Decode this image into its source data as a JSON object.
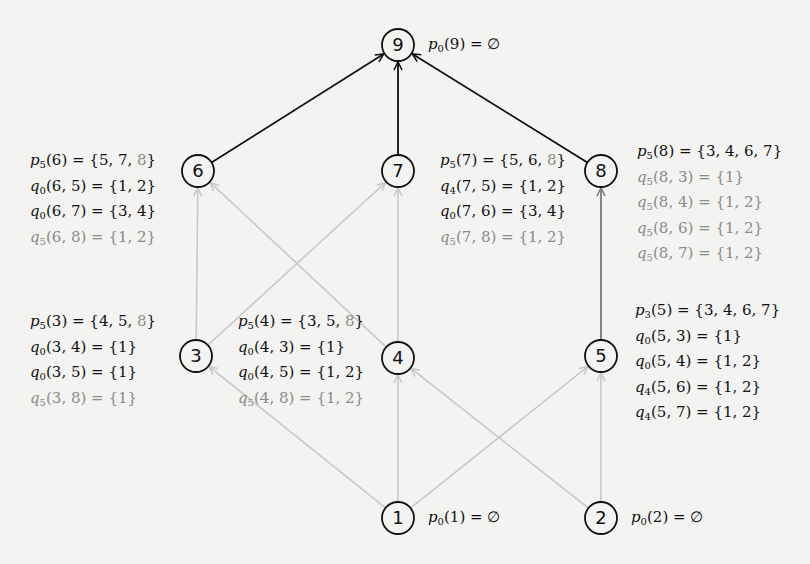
{
  "diagram": {
    "colors": {
      "background": "#f3f3f1",
      "strong_edge": "#111111",
      "medium_edge": "#7a7a7a",
      "light_edge": "#c8c8c8",
      "node_stroke": "#111111",
      "gray_text": "#8a8a8a"
    },
    "nodes": [
      {
        "id": "1",
        "label": "1",
        "x": 398,
        "y": 518
      },
      {
        "id": "2",
        "label": "2",
        "x": 601,
        "y": 518
      },
      {
        "id": "3",
        "label": "3",
        "x": 196,
        "y": 356
      },
      {
        "id": "4",
        "label": "4",
        "x": 398,
        "y": 358
      },
      {
        "id": "5",
        "label": "5",
        "x": 601,
        "y": 356
      },
      {
        "id": "6",
        "label": "6",
        "x": 198,
        "y": 171
      },
      {
        "id": "7",
        "label": "7",
        "x": 398,
        "y": 171
      },
      {
        "id": "8",
        "label": "8",
        "x": 601,
        "y": 171
      },
      {
        "id": "9",
        "label": "9",
        "x": 398,
        "y": 45
      }
    ],
    "edges": [
      {
        "from": "1",
        "to": "3",
        "style": "light"
      },
      {
        "from": "1",
        "to": "4",
        "style": "light"
      },
      {
        "from": "1",
        "to": "5",
        "style": "light"
      },
      {
        "from": "2",
        "to": "4",
        "style": "light"
      },
      {
        "from": "2",
        "to": "5",
        "style": "light"
      },
      {
        "from": "3",
        "to": "6",
        "style": "light"
      },
      {
        "from": "3",
        "to": "7",
        "style": "light"
      },
      {
        "from": "4",
        "to": "6",
        "style": "light"
      },
      {
        "from": "4",
        "to": "7",
        "style": "light"
      },
      {
        "from": "5",
        "to": "8",
        "style": "medium"
      },
      {
        "from": "6",
        "to": "9",
        "style": "strong"
      },
      {
        "from": "7",
        "to": "9",
        "style": "strong"
      },
      {
        "from": "8",
        "to": "9",
        "style": "strong"
      }
    ],
    "annotations": {
      "n9": {
        "lines": [
          {
            "fn": "p",
            "sub": "0",
            "args": "(9)",
            "rhs": " = ∅",
            "gray": false
          }
        ]
      },
      "n1": {
        "lines": [
          {
            "fn": "p",
            "sub": "0",
            "args": "(1)",
            "rhs": " = ∅",
            "gray": false
          }
        ]
      },
      "n2": {
        "lines": [
          {
            "fn": "p",
            "sub": "0",
            "args": "(2)",
            "rhs": " = ∅",
            "gray": false
          }
        ]
      },
      "n6": {
        "lines": [
          {
            "fn": "p",
            "sub": "5",
            "args": "(6)",
            "rhs": " = {5, 7, ",
            "rhs_gray": "8",
            "rhs_end": "}",
            "gray": false
          },
          {
            "fn": "q",
            "sub": "0",
            "args": "(6, 5)",
            "rhs": " = {1, 2}",
            "gray": false
          },
          {
            "fn": "q",
            "sub": "0",
            "args": "(6, 7)",
            "rhs": " = {3, 4}",
            "gray": false
          },
          {
            "fn": "q",
            "sub": "5",
            "args": "(6, 8)",
            "rhs": " = {1, 2}",
            "gray": true
          }
        ]
      },
      "n7": {
        "lines": [
          {
            "fn": "p",
            "sub": "5",
            "args": "(7)",
            "rhs": " = {5, 6, ",
            "rhs_gray": "8",
            "rhs_end": "}",
            "gray": false
          },
          {
            "fn": "q",
            "sub": "4",
            "args": "(7, 5)",
            "rhs": " = {1, 2}",
            "gray": false
          },
          {
            "fn": "q",
            "sub": "0",
            "args": "(7, 6)",
            "rhs": " = {3, 4}",
            "gray": false
          },
          {
            "fn": "q",
            "sub": "5",
            "args": "(7, 8)",
            "rhs": " = {1, 2}",
            "gray": true
          }
        ]
      },
      "n8": {
        "lines": [
          {
            "fn": "p",
            "sub": "5",
            "args": "(8)",
            "rhs": " = {3, 4, 6, 7}",
            "gray": false
          },
          {
            "fn": "q",
            "sub": "5",
            "args": "(8, 3)",
            "rhs": " = {1}",
            "gray": true
          },
          {
            "fn": "q",
            "sub": "5",
            "args": "(8, 4)",
            "rhs": " = {1, 2}",
            "gray": true
          },
          {
            "fn": "q",
            "sub": "5",
            "args": "(8, 6)",
            "rhs": " = {1, 2}",
            "gray": true
          },
          {
            "fn": "q",
            "sub": "5",
            "args": "(8, 7)",
            "rhs": " = {1, 2}",
            "gray": true
          }
        ]
      },
      "n3": {
        "lines": [
          {
            "fn": "p",
            "sub": "5",
            "args": "(3)",
            "rhs": " = {4, 5, ",
            "rhs_gray": "8",
            "rhs_end": "}",
            "gray": false
          },
          {
            "fn": "q",
            "sub": "0",
            "args": "(3, 4)",
            "rhs": " = {1}",
            "gray": false
          },
          {
            "fn": "q",
            "sub": "0",
            "args": "(3, 5)",
            "rhs": " = {1}",
            "gray": false
          },
          {
            "fn": "q",
            "sub": "5",
            "args": "(3, 8)",
            "rhs": " = {1}",
            "gray": true
          }
        ]
      },
      "n4": {
        "lines": [
          {
            "fn": "p",
            "sub": "5",
            "args": "(4)",
            "rhs": " = {3, 5, ",
            "rhs_gray": "8",
            "rhs_end": "}",
            "gray": false
          },
          {
            "fn": "q",
            "sub": "0",
            "args": "(4, 3)",
            "rhs": " = {1}",
            "gray": false
          },
          {
            "fn": "q",
            "sub": "0",
            "args": "(4, 5)",
            "rhs": " = {1, 2}",
            "gray": false
          },
          {
            "fn": "q",
            "sub": "5",
            "args": "(4, 8)",
            "rhs": " = {1, 2}",
            "gray": true
          }
        ]
      },
      "n5": {
        "lines": [
          {
            "fn": "p",
            "sub": "3",
            "args": "(5)",
            "rhs": " = {3, 4, 6, 7}",
            "gray": false
          },
          {
            "fn": "q",
            "sub": "0",
            "args": "(5, 3)",
            "rhs": " = {1}",
            "gray": false
          },
          {
            "fn": "q",
            "sub": "0",
            "args": "(5, 4)",
            "rhs": " = {1, 2}",
            "gray": false
          },
          {
            "fn": "q",
            "sub": "4",
            "args": "(5, 6)",
            "rhs": " = {1, 2}",
            "gray": false
          },
          {
            "fn": "q",
            "sub": "4",
            "args": "(5, 7)",
            "rhs": " = {1, 2}",
            "gray": false
          }
        ]
      }
    },
    "annotation_positions": {
      "n9": {
        "left": 428,
        "top": 34
      },
      "n1": {
        "left": 428,
        "top": 507
      },
      "n2": {
        "left": 631,
        "top": 507
      },
      "n6": {
        "left": 30,
        "top": 150
      },
      "n7": {
        "left": 440,
        "top": 150
      },
      "n8": {
        "left": 637,
        "top": 141
      },
      "n3": {
        "left": 30,
        "top": 311
      },
      "n4": {
        "left": 238,
        "top": 311
      },
      "n5": {
        "left": 635,
        "top": 300
      }
    }
  }
}
